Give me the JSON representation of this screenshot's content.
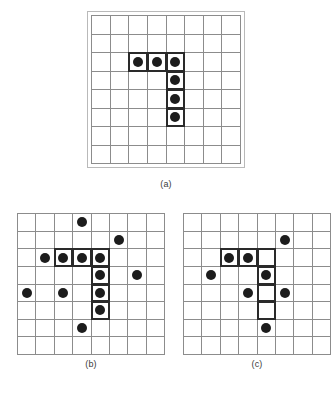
{
  "figure": {
    "background_color": "#ffffff",
    "dot_color": "#1c1c1c",
    "grid_line_color": "#8c8c8c",
    "highlight_border_color": "#2a2a2a",
    "outer_frame_color": "#b9b9b9",
    "caption_color": "#3b3b3b"
  },
  "panels": [
    {
      "id": "panel-a",
      "caption": "(a)",
      "rows": 8,
      "cols": 8,
      "has_outer_frame": true,
      "dots": [
        {
          "row": 2,
          "col": 2
        },
        {
          "row": 2,
          "col": 3
        },
        {
          "row": 2,
          "col": 4
        },
        {
          "row": 3,
          "col": 4
        },
        {
          "row": 4,
          "col": 4
        },
        {
          "row": 5,
          "col": 4
        }
      ],
      "highlights": [
        {
          "row": 2,
          "col": 2
        },
        {
          "row": 2,
          "col": 3
        },
        {
          "row": 2,
          "col": 4
        },
        {
          "row": 3,
          "col": 4
        },
        {
          "row": 4,
          "col": 4
        },
        {
          "row": 5,
          "col": 4
        }
      ]
    },
    {
      "id": "panel-b",
      "caption": "(b)",
      "rows": 8,
      "cols": 8,
      "has_outer_frame": false,
      "dots": [
        {
          "row": 0,
          "col": 3
        },
        {
          "row": 1,
          "col": 5
        },
        {
          "row": 2,
          "col": 1
        },
        {
          "row": 2,
          "col": 2
        },
        {
          "row": 2,
          "col": 3
        },
        {
          "row": 2,
          "col": 4
        },
        {
          "row": 3,
          "col": 4
        },
        {
          "row": 3,
          "col": 6
        },
        {
          "row": 4,
          "col": 0
        },
        {
          "row": 4,
          "col": 2
        },
        {
          "row": 4,
          "col": 4
        },
        {
          "row": 5,
          "col": 4
        },
        {
          "row": 6,
          "col": 3
        }
      ],
      "highlights": [
        {
          "row": 2,
          "col": 2
        },
        {
          "row": 2,
          "col": 3
        },
        {
          "row": 2,
          "col": 4
        },
        {
          "row": 3,
          "col": 4
        },
        {
          "row": 4,
          "col": 4
        },
        {
          "row": 5,
          "col": 4
        }
      ]
    },
    {
      "id": "panel-c",
      "caption": "(c)",
      "rows": 8,
      "cols": 8,
      "has_outer_frame": false,
      "dots": [
        {
          "row": 1,
          "col": 5
        },
        {
          "row": 2,
          "col": 2
        },
        {
          "row": 2,
          "col": 3
        },
        {
          "row": 3,
          "col": 1
        },
        {
          "row": 3,
          "col": 4
        },
        {
          "row": 4,
          "col": 3
        },
        {
          "row": 4,
          "col": 5
        },
        {
          "row": 6,
          "col": 4
        }
      ],
      "highlights": [
        {
          "row": 2,
          "col": 2
        },
        {
          "row": 2,
          "col": 3
        },
        {
          "row": 2,
          "col": 4
        },
        {
          "row": 3,
          "col": 4
        },
        {
          "row": 4,
          "col": 4
        },
        {
          "row": 5,
          "col": 4
        }
      ]
    }
  ]
}
